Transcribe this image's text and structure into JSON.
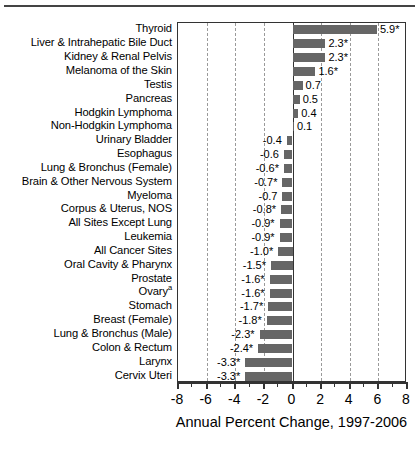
{
  "chart_data": {
    "type": "bar",
    "orientation": "horizontal",
    "title": "",
    "xlabel": "Annual Percent Change, 1997-2006",
    "ylabel": "",
    "xlim": [
      -8,
      8
    ],
    "xticks": [
      -8,
      -6,
      -4,
      -2,
      0,
      2,
      4,
      6,
      8
    ],
    "xtick_labels": [
      "-8",
      "-6",
      "-4",
      "-2",
      "0",
      "2",
      "4",
      "6",
      "8"
    ],
    "minor_tick_step": 1,
    "gridlines": [
      -6,
      -4,
      -2,
      2,
      4,
      6
    ],
    "grid": true,
    "grid_style": "dashed",
    "legend": "none",
    "bar_color": "#666666",
    "categories": [
      "Thyroid",
      "Liver & Intrahepatic Bile Duct",
      "Kidney & Renal Pelvis",
      "Melanoma of the Skin",
      "Testis",
      "Pancreas",
      "Hodgkin Lymphoma",
      "Non-Hodgkin Lymphoma",
      "Urinary Bladder",
      "Esophagus",
      "Lung & Bronchus (Female)",
      "Brain & Other Nervous System",
      "Myeloma",
      "Corpus & Uterus, NOS",
      "All Sites Except Lung",
      "Leukemia",
      "All Cancer Sites",
      "Oral Cavity & Pharynx",
      "Prostate",
      "Ovary",
      "Stomach",
      "Breast (Female)",
      "Lung & Bronchus (Male)",
      "Colon & Rectum",
      "Larynx",
      "Cervix Uteri"
    ],
    "category_superscripts": {
      "Ovary": "a"
    },
    "values": [
      5.9,
      2.3,
      2.3,
      1.6,
      0.7,
      0.5,
      0.4,
      0.1,
      -0.4,
      -0.6,
      -0.6,
      -0.7,
      -0.7,
      -0.8,
      -0.9,
      -0.9,
      -1.0,
      -1.5,
      -1.6,
      -1.6,
      -1.7,
      -1.8,
      -2.3,
      -2.4,
      -3.3,
      -3.3
    ],
    "value_labels": [
      "5.9*",
      "2.3*",
      "2.3*",
      "1.6*",
      "0.7",
      "0.5",
      "0.4",
      "0.1",
      "-0.4",
      "-0.6",
      "-0.6*",
      "-0.7*",
      "-0.7",
      "-0.8*",
      "-0.9*",
      "-0.9*",
      "-1.0*",
      "-1.5*",
      "-1.6*",
      "-1.6*",
      "-1.7*",
      "-1.8*",
      "-2.3*",
      "-2.4*",
      "-3.3*",
      "-3.3*"
    ],
    "significance_marker": "*",
    "significant_flags": [
      true,
      true,
      true,
      true,
      false,
      false,
      false,
      false,
      false,
      false,
      true,
      true,
      false,
      true,
      true,
      true,
      true,
      true,
      true,
      true,
      true,
      true,
      true,
      true,
      true,
      true
    ]
  }
}
